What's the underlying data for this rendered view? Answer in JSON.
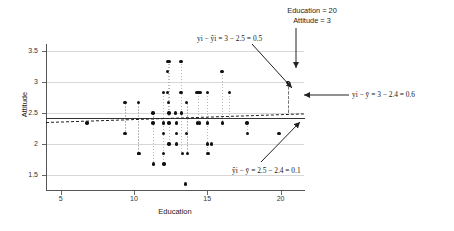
{
  "chart_data": {
    "type": "scatter",
    "title": "",
    "xlabel": "Education",
    "ylabel": "Attitude",
    "xlim": [
      4.0,
      21.6
    ],
    "ylim": [
      1.25,
      3.62
    ],
    "xticks": [
      5,
      10,
      15,
      20
    ],
    "yticks": [
      1.5,
      2,
      2.5,
      3,
      3.5
    ],
    "ytick_labels": [
      "1.5",
      "2",
      "2.5",
      "3",
      "3.5"
    ],
    "xtick_labels": [
      "5",
      "10",
      "15",
      "20"
    ],
    "grid": "horizontal",
    "legend": "none",
    "mean_line_y": 2.42,
    "regression_line": {
      "y_at_xmin": 2.36,
      "y_at_xmax": 2.5
    },
    "highlighted_point": {
      "x": 20.5,
      "y": 3.0,
      "fitted_y": 2.5
    },
    "points": [
      [
        6.8,
        2.34
      ],
      [
        9.4,
        2.67
      ],
      [
        9.4,
        2.17
      ],
      [
        10.3,
        2.67
      ],
      [
        10.3,
        1.84
      ],
      [
        10.35,
        1.84
      ],
      [
        11.3,
        2.5
      ],
      [
        11.3,
        2.34
      ],
      [
        11.35,
        1.67
      ],
      [
        12.0,
        2.83
      ],
      [
        12.0,
        2.34
      ],
      [
        12.0,
        2.17
      ],
      [
        12.0,
        1.84
      ],
      [
        12.05,
        1.67
      ],
      [
        12.3,
        3.34
      ],
      [
        12.4,
        3.34
      ],
      [
        12.3,
        3.17
      ],
      [
        12.3,
        2.83
      ],
      [
        12.35,
        2.67
      ],
      [
        12.4,
        2.5
      ],
      [
        12.4,
        2.34
      ],
      [
        12.4,
        2.0
      ],
      [
        12.85,
        2.5
      ],
      [
        12.9,
        2.34
      ],
      [
        12.9,
        2.17
      ],
      [
        12.9,
        2.0
      ],
      [
        13.2,
        3.34
      ],
      [
        13.2,
        2.83
      ],
      [
        13.25,
        2.5
      ],
      [
        13.3,
        1.84
      ],
      [
        13.5,
        1.35
      ],
      [
        13.6,
        2.67
      ],
      [
        13.6,
        2.17
      ],
      [
        13.65,
        1.84
      ],
      [
        14.3,
        2.83
      ],
      [
        14.35,
        2.34
      ],
      [
        14.4,
        2.83
      ],
      [
        14.5,
        2.83
      ],
      [
        14.45,
        2.34
      ],
      [
        15.0,
        2.83
      ],
      [
        15.0,
        2.34
      ],
      [
        15.0,
        2.0
      ],
      [
        15.05,
        1.84
      ],
      [
        15.3,
        2.0
      ],
      [
        16.0,
        3.17
      ],
      [
        16.05,
        2.34
      ],
      [
        16.5,
        2.83
      ],
      [
        17.7,
        2.34
      ],
      [
        17.75,
        2.17
      ],
      [
        19.9,
        2.17
      ],
      [
        20.5,
        3.0
      ]
    ],
    "residual_segments": [
      [
        9.4,
        2.67,
        2.42
      ],
      [
        9.4,
        2.17,
        2.42
      ],
      [
        10.3,
        2.67,
        1.84
      ],
      [
        11.3,
        2.5,
        1.67
      ],
      [
        12.0,
        2.83,
        1.67
      ],
      [
        12.3,
        3.34,
        2.42
      ],
      [
        12.4,
        3.34,
        2.0
      ],
      [
        13.2,
        3.34,
        1.84
      ],
      [
        13.6,
        2.67,
        1.84
      ],
      [
        14.35,
        2.83,
        2.34
      ],
      [
        15.0,
        2.83,
        1.84
      ],
      [
        16.0,
        3.17,
        2.34
      ],
      [
        16.5,
        2.83,
        2.42
      ],
      [
        17.7,
        2.34,
        2.17
      ],
      [
        20.5,
        3.0,
        2.5
      ]
    ],
    "annotations": [
      {
        "name": "point-callout",
        "lines": [
          "Education = 20",
          "Attitude = 3"
        ]
      },
      {
        "name": "residual-label",
        "text": "yi − ŷi = 3 − 2.5 = 0.5"
      },
      {
        "name": "total-deviation-label",
        "text": "yi − ȳ = 3 − 2.4 = 0.6"
      },
      {
        "name": "explained-deviation-label",
        "text": "ŷi − ȳ = 2.5 − 2.4 = 0.1"
      }
    ]
  },
  "callout": {
    "line1": "Education = 20",
    "line2": "Attitude = 3"
  },
  "labels": {
    "residual": "yi − ŷi = 3 − 2.5 = 0.5",
    "total": "yi − ȳ = 3 − 2.4 = 0.6",
    "explained": "ŷi − ȳ = 2.5 − 2.4 = 0.1",
    "xaxis": "Education",
    "yaxis": "Attitude"
  },
  "colors": {
    "point": "#111111",
    "grid": "#d8d8d8",
    "mean_line": "#333333",
    "regression_line": "#222222",
    "residual": "#b9b9b9",
    "arrow": "#222222"
  }
}
